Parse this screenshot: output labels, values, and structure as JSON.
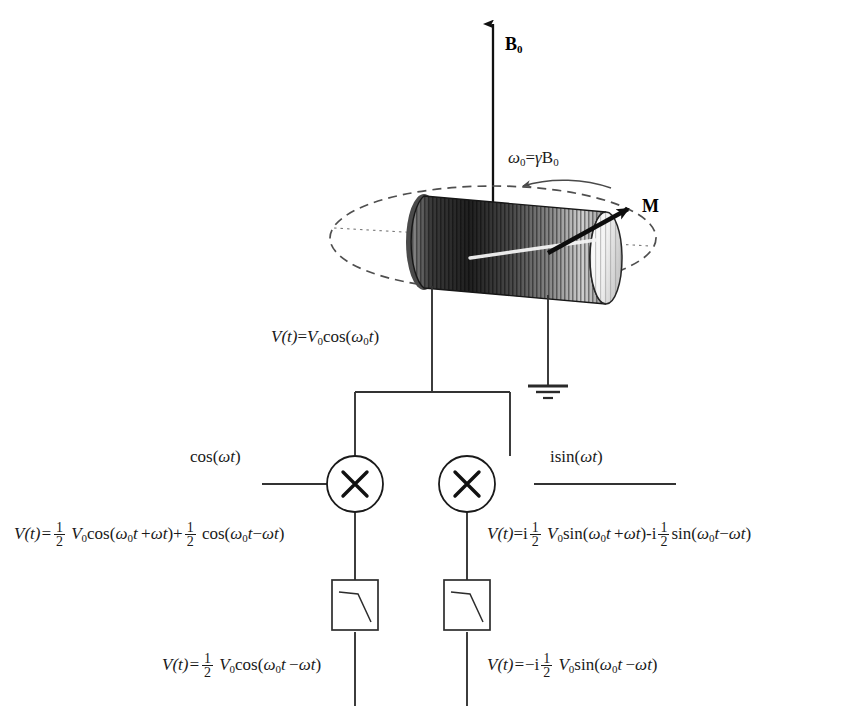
{
  "diagram": {
    "field_label": "B",
    "field_sub": "0",
    "magnetization_label": "M",
    "larmor": {
      "omega": "ω",
      "omega_sub": "0",
      "equals": "=",
      "gamma": "γ",
      "b": "B",
      "b_sub": "0"
    },
    "ground_label": "ground",
    "coil_label": "sample-coil"
  },
  "signal": {
    "coil_output": {
      "v": "V",
      "t": "(t)",
      "eq": "=",
      "v0": "V",
      "v0_sub": "0",
      "fn": "cos(",
      "omega": "ω",
      "omega_sub": "0",
      "var": "t",
      "close": ")"
    }
  },
  "mixers": {
    "symbol": "X",
    "left_reference": {
      "fn": "cos(",
      "omega": "ω",
      "var": "t",
      "close": ")"
    },
    "right_reference": {
      "prefix": "i",
      "fn": "sin(",
      "omega": "ω",
      "var": "t",
      "close": ")"
    }
  },
  "filters": {
    "left_name": "low-pass-filter",
    "right_name": "low-pass-filter"
  },
  "equations": {
    "mixer_left_out": {
      "lead": "V(t)=",
      "half_num": "1",
      "half_den": "2",
      "v0": "V",
      "v0_sub": "0",
      "fn1": "cos(",
      "w0": "ω",
      "w0_sub": "0",
      "t1": "t",
      "plus": "+",
      "w1": "ω",
      "t2": "t",
      "close1": ")",
      "plus2": "+",
      "h2_num": "1",
      "h2_den": "2",
      "fn2": "cos(",
      "w2": "ω",
      "w2_sub": "0",
      "t3": "t",
      "minus": "−",
      "w3": "ω",
      "t4": "t",
      "close2": ")"
    },
    "mixer_right_out": {
      "lead": "V(t)",
      "eq": "=",
      "i1": "i",
      "half_num": "1",
      "half_den": "2",
      "v0": "V",
      "v0_sub": "0",
      "fn1": "sin(",
      "w0": "ω",
      "w0_sub": "0",
      "t1": "t",
      "plus": "+",
      "w1": "ω",
      "t2": "t",
      "close1": ")",
      "minus_i": "-i",
      "h2_num": "1",
      "h2_den": "2",
      "fn2": "sin(",
      "w2": "ω",
      "w2_sub": "0",
      "t3": "t",
      "minus": "−",
      "w3": "ω",
      "t4": "t",
      "close2": ")"
    },
    "filter_left_out": {
      "lead": "V(t)=",
      "half_num": "1",
      "half_den": "2",
      "v0": "V",
      "v0_sub": "0",
      "fn": "cos(",
      "w0": "ω",
      "w0_sub": "0",
      "t1": "t",
      "minus": "−",
      "w1": "ω",
      "t2": "t",
      "close": ")"
    },
    "filter_right_out": {
      "lead": "V(t)=",
      "sign": "−i",
      "half_num": "1",
      "half_den": "2",
      "v0": "V",
      "v0_sub": "0",
      "fn": "sin(",
      "w0": "ω",
      "w0_sub": "0",
      "t1": "t",
      "minus": "−",
      "w1": "ω",
      "t2": "t",
      "close": ")"
    }
  },
  "colors": {
    "ink": "#1a1a1a",
    "wire": "#333333",
    "dash": "#555555",
    "coil_dark": "#2b2b2b",
    "coil_light": "#e8e8e8"
  }
}
